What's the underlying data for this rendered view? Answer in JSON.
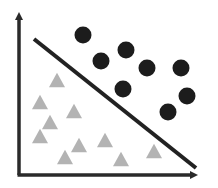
{
  "diagram": {
    "type": "linear-classifier-separation",
    "background": "#ffffff",
    "axes": {
      "color": "#2a2a2a",
      "stroke_width": 3.5,
      "origin": [
        19,
        175
      ],
      "y_axis_top": [
        19,
        10
      ],
      "x_axis_right": [
        200,
        175
      ],
      "x_label": "",
      "y_label": ""
    },
    "separator_line": {
      "color": "#222222",
      "stroke_width": 4,
      "start": [
        34,
        39
      ],
      "end": [
        196,
        168
      ]
    },
    "classes": [
      {
        "name": "class-a",
        "shape": "circle",
        "color": "#1c1c1c",
        "radius": 8.5,
        "points": [
          [
            83,
            35
          ],
          [
            126,
            50
          ],
          [
            101,
            61
          ],
          [
            147,
            68
          ],
          [
            181,
            68
          ],
          [
            123,
            89
          ],
          [
            187,
            96
          ],
          [
            168,
            112
          ]
        ]
      },
      {
        "name": "class-b",
        "shape": "triangle",
        "color": "#b3b3b3",
        "size": 16,
        "points": [
          [
            57,
            80
          ],
          [
            40,
            102
          ],
          [
            74,
            111
          ],
          [
            50,
            122
          ],
          [
            40,
            136
          ],
          [
            105,
            140
          ],
          [
            79,
            145
          ],
          [
            154,
            151
          ],
          [
            65,
            157
          ],
          [
            121,
            159
          ]
        ]
      }
    ]
  }
}
